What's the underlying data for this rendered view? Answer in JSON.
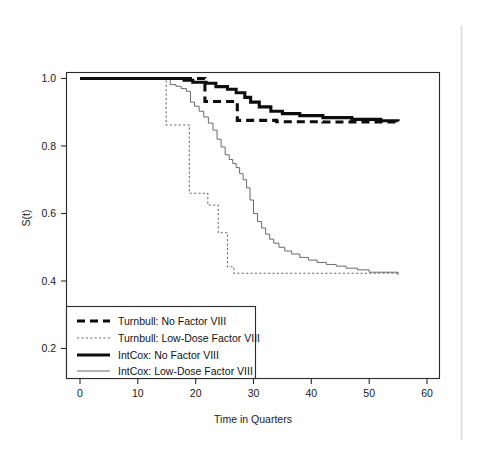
{
  "figure": {
    "background_color": "#fefefe",
    "ink_color": "#0d0d0d",
    "thin_line_color": "#6b6b6b"
  },
  "axes": {
    "y_axis_title": "S(t)",
    "x_axis_title": "Time in Quarters",
    "x_ticks": [
      "0",
      "10",
      "20",
      "30",
      "40",
      "50",
      "60"
    ],
    "y_ticks": [
      "0.2",
      "0.4",
      "0.6",
      "0.8",
      "1.0"
    ]
  },
  "legend": {
    "entries": [
      {
        "label": "Turnbull: No Factor VIII",
        "style": "thick-dashed"
      },
      {
        "label": "Turnbull: Low-Dose Factor VIII",
        "style": "thin-dotted"
      },
      {
        "label": "IntCox: No Factor VIII",
        "style": "thick-solid"
      },
      {
        "label": "IntCox: Low-Dose Factor VIII",
        "style": "thin-solid"
      }
    ]
  },
  "chart_data": {
    "type": "line",
    "title": "",
    "subtitle": "",
    "xlabel": "Time in Quarters",
    "ylabel": "S(t)",
    "xlim": [
      -2,
      62
    ],
    "ylim": [
      0.14,
      1.03
    ],
    "x_ticks": [
      0,
      10,
      20,
      30,
      40,
      50,
      60
    ],
    "y_ticks": [
      0.2,
      0.4,
      0.6,
      0.8,
      1.0
    ],
    "grid": false,
    "legend_position": "lower-left",
    "step_interpolation": "post",
    "series": [
      {
        "name": "Turnbull: No Factor VIII",
        "style": "thick-dashed",
        "x": [
          0,
          21.6,
          21.6,
          27.2,
          27.2,
          34.0,
          34.0,
          42.0,
          42.0,
          48.0,
          48.0,
          55.0
        ],
        "y": [
          1.0,
          1.0,
          0.932,
          0.932,
          0.876,
          0.876,
          0.872,
          0.872,
          0.871,
          0.871,
          0.871,
          0.871
        ]
      },
      {
        "name": "Turnbull: Low-Dose Factor VIII",
        "style": "thin-dotted",
        "x": [
          0,
          14.9,
          14.9,
          18.9,
          18.9,
          22.1,
          22.1,
          23.9,
          23.9,
          25.5,
          25.5,
          26.6,
          26.6,
          55.0
        ],
        "y": [
          1.0,
          1.0,
          0.862,
          0.862,
          0.66,
          0.66,
          0.625,
          0.625,
          0.543,
          0.543,
          0.442,
          0.442,
          0.423,
          0.423
        ]
      },
      {
        "name": "IntCox: No Factor VIII",
        "style": "thick-solid",
        "x": [
          0,
          14.0,
          18.0,
          19.5,
          21.8,
          23.5,
          25.5,
          27.0,
          28.5,
          29.5,
          31.0,
          33.0,
          35.0,
          38.0,
          42.0,
          47.0,
          52.0,
          55.0
        ],
        "y": [
          1.0,
          1.0,
          0.995,
          0.989,
          0.986,
          0.976,
          0.968,
          0.958,
          0.944,
          0.93,
          0.916,
          0.903,
          0.896,
          0.89,
          0.884,
          0.879,
          0.875,
          0.873
        ]
      },
      {
        "name": "IntCox: Low-Dose Factor VIII",
        "style": "thin-solid",
        "x": [
          0,
          14.9,
          15.6,
          16.6,
          17.5,
          18.4,
          19.1,
          19.8,
          20.6,
          21.4,
          22.2,
          23.0,
          23.7,
          24.4,
          25.1,
          25.8,
          26.4,
          27.0,
          27.6,
          28.2,
          28.8,
          29.4,
          30.0,
          30.7,
          31.4,
          32.1,
          32.8,
          33.5,
          34.4,
          35.4,
          36.6,
          38.0,
          39.5,
          41.0,
          42.6,
          44.3,
          46.0,
          48.0,
          50.0,
          55.0
        ],
        "y": [
          1.0,
          1.0,
          0.982,
          0.977,
          0.97,
          0.962,
          0.93,
          0.918,
          0.903,
          0.886,
          0.868,
          0.847,
          0.82,
          0.797,
          0.774,
          0.76,
          0.748,
          0.736,
          0.718,
          0.7,
          0.676,
          0.64,
          0.6,
          0.576,
          0.557,
          0.539,
          0.524,
          0.512,
          0.5,
          0.489,
          0.48,
          0.47,
          0.462,
          0.455,
          0.449,
          0.444,
          0.438,
          0.433,
          0.426,
          0.418
        ]
      }
    ]
  }
}
